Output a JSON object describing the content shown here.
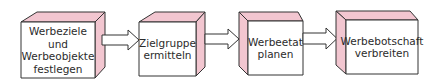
{
  "diagram": {
    "type": "process-flow",
    "face_color": "#f2c6d0",
    "front_color": "#ffffff",
    "stroke_color": "#333333",
    "steps": [
      {
        "label": "Werbeziele\nund\nWerbeobjekte\nfestlegen"
      },
      {
        "label": "Zielgruppe\nermitteln"
      },
      {
        "label": "Werbeetat\nplanen"
      },
      {
        "label": "Werbebotschaft\nverbreiten"
      }
    ],
    "arrows": [
      {
        "from": 0,
        "to": 1
      },
      {
        "from": 1,
        "to": 2
      },
      {
        "from": 2,
        "to": 3
      }
    ]
  }
}
